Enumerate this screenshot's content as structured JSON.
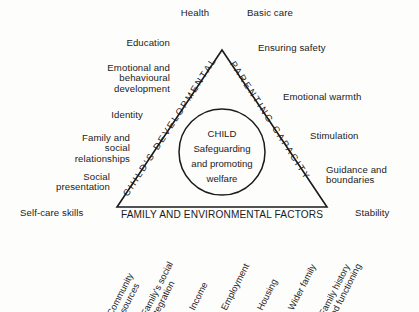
{
  "diagram": {
    "core": {
      "lines": [
        "CHILD",
        "Safeguarding",
        "and promoting",
        "welfare"
      ]
    },
    "edges": {
      "left": "CHILD'S DEVELOPMENTAL NEEDS",
      "right": "PARENTING CAPACITY",
      "base": "FAMILY AND ENVIRONMENTAL FACTORS"
    },
    "developmental_needs": [
      {
        "label": "Health"
      },
      {
        "label": "Education"
      },
      {
        "label": "Emotional and\nbehavioural\ndevelopment"
      },
      {
        "label": "Identity"
      },
      {
        "label": "Family and\nsocial\nrelationships"
      },
      {
        "label": "Social\npresentation"
      },
      {
        "label": "Self-care skills"
      }
    ],
    "parenting_capacity": [
      {
        "label": "Basic care"
      },
      {
        "label": "Ensuring safety"
      },
      {
        "label": "Emotional warmth"
      },
      {
        "label": "Stimulation"
      },
      {
        "label": "Guidance and\nboundaries"
      },
      {
        "label": "Stability"
      }
    ],
    "family_environmental_factors": [
      {
        "label": "Community\nresources"
      },
      {
        "label": "Family's social\nintegration"
      },
      {
        "label": "Income"
      },
      {
        "label": "Employment"
      },
      {
        "label": "Housing"
      },
      {
        "label": "Wider family"
      },
      {
        "label": "Family history\nand functioning"
      }
    ],
    "colors": {
      "background": "#fdfdfc",
      "stroke": "#1b1b1b",
      "text": "#222222"
    }
  }
}
